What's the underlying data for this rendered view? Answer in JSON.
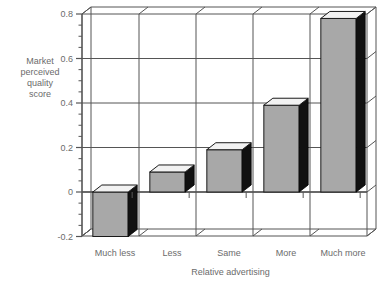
{
  "chart_data": {
    "type": "bar",
    "title": "",
    "xlabel": "Relative advertising",
    "ylabel": "Market perceived quality score",
    "ylabel_lines": [
      "Market",
      "perceived",
      "quality",
      "score"
    ],
    "categories": [
      "Much less",
      "Less",
      "Same",
      "More",
      "Much more"
    ],
    "values": [
      -0.2,
      0.09,
      0.19,
      0.39,
      0.78
    ],
    "ylim": [
      -0.2,
      0.8
    ],
    "ytick_labels": [
      "0.8",
      "0.6",
      "0.4",
      "0.2",
      "0",
      "-0.2"
    ],
    "ytick_values": [
      0.8,
      0.6,
      0.4,
      0.2,
      0,
      -0.2
    ],
    "minor_tick_step": 0.05,
    "grid": true,
    "legend": "none",
    "style": "3d-bar",
    "colors": {
      "bar_front": "#a8a8a8",
      "bar_top": "#f2f2f2",
      "bar_side": "#111111",
      "axis": "#555555",
      "grid": "#555555",
      "text": "#6b6b6b",
      "background": "#ffffff"
    }
  }
}
